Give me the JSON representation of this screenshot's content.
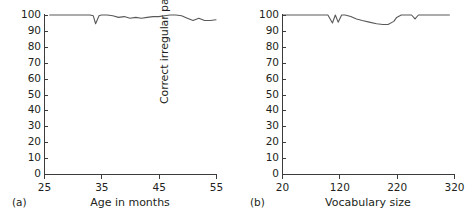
{
  "figure": {
    "background": "#ffffff",
    "line_color": "#58595b",
    "axis_color": "#3c3c3c"
  },
  "panels": [
    {
      "tag": "(a)",
      "ylabel": "Correct irregular past tense (%)",
      "xlabel": "Age in months",
      "yticks": [
        0,
        10,
        20,
        30,
        40,
        50,
        60,
        70,
        80,
        90,
        100
      ],
      "xticks": [
        25,
        35,
        45,
        55
      ]
    },
    {
      "tag": "(b)",
      "ylabel": "Correct irregular past tense (%)",
      "xlabel": "Vocabulary size",
      "yticks": [
        0,
        10,
        20,
        30,
        40,
        50,
        60,
        70,
        80,
        90,
        100
      ],
      "xticks": [
        20,
        120,
        220,
        320
      ]
    }
  ],
  "chart_data": [
    {
      "type": "line",
      "title": "",
      "panel": "(a)",
      "xlabel": "Age in months",
      "ylabel": "Correct irregular past tense (%)",
      "xlim": [
        25,
        55
      ],
      "ylim": [
        0,
        100
      ],
      "xticks": [
        25,
        35,
        45,
        55
      ],
      "yticks": [
        0,
        10,
        20,
        30,
        40,
        50,
        60,
        70,
        80,
        90,
        100
      ],
      "grid": false,
      "legend": "none",
      "series": [
        {
          "name": "Correct irregular past tense",
          "x": [
            26,
            27,
            28,
            29,
            30,
            31,
            32,
            33,
            33.6,
            34,
            34.6,
            35,
            36,
            37,
            38,
            39,
            40,
            41,
            42,
            43,
            44,
            45,
            46,
            47,
            48,
            49,
            50,
            51,
            52,
            53,
            54,
            55
          ],
          "y": [
            100,
            100,
            100,
            100,
            100,
            100,
            100,
            100,
            99.5,
            94.5,
            99.5,
            100,
            100,
            99.5,
            98.5,
            99,
            98,
            98.5,
            98,
            98.5,
            99,
            99,
            99.5,
            100,
            100,
            99.5,
            98,
            96.5,
            98,
            96.5,
            96.5,
            97
          ]
        }
      ]
    },
    {
      "type": "line",
      "title": "",
      "panel": "(b)",
      "xlabel": "Vocabulary size",
      "ylabel": "Correct irregular past tense (%)",
      "xlim": [
        20,
        320
      ],
      "ylim": [
        0,
        100
      ],
      "xticks": [
        20,
        120,
        220,
        320
      ],
      "yticks": [
        0,
        10,
        20,
        30,
        40,
        50,
        60,
        70,
        80,
        90,
        100
      ],
      "grid": false,
      "legend": "none",
      "series": [
        {
          "name": "Correct irregular past tense",
          "x": [
            22,
            40,
            60,
            80,
            95,
            100,
            108,
            113,
            118,
            124,
            130,
            140,
            150,
            160,
            172,
            185,
            196,
            205,
            215,
            220,
            228,
            238,
            246,
            252,
            258,
            265,
            275,
            290,
            305,
            312
          ],
          "y": [
            100,
            100,
            100,
            100,
            100,
            100,
            95,
            100,
            95.5,
            100,
            100,
            99,
            97.5,
            96.5,
            95.5,
            94.5,
            94,
            94,
            96,
            98.5,
            100,
            100,
            100,
            97.5,
            100,
            100,
            100,
            100,
            100,
            100
          ]
        }
      ]
    }
  ]
}
